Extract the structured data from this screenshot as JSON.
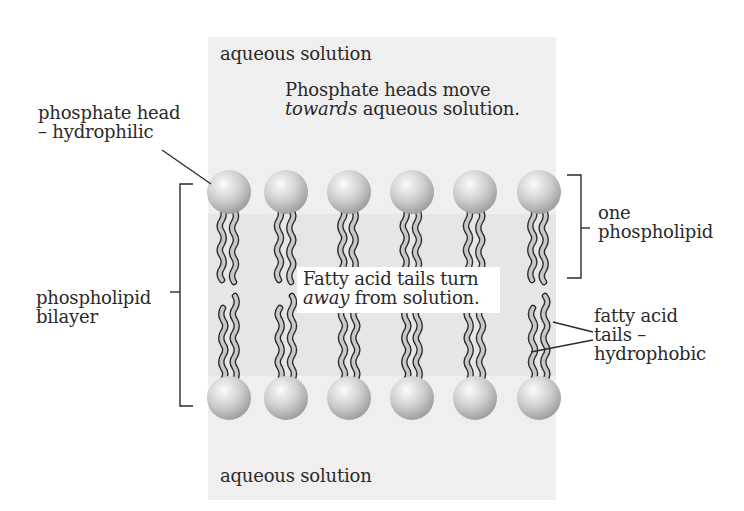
{
  "diagram": {
    "regions": {
      "top_solution": "aqueous solution",
      "bottom_solution": "aqueous solution"
    },
    "captions": {
      "heads_line1": "Phosphate heads move",
      "heads_line2_italic": "towards",
      "heads_line2_rest": " aqueous solution.",
      "tails_line1": "Fatty acid tails turn",
      "tails_line2_italic": "away",
      "tails_line2_rest": " from solution."
    },
    "labels": {
      "phosphate_head_line1": "phosphate head",
      "phosphate_head_line2": "– hydrophilic",
      "bilayer_line1": "phospholipid",
      "bilayer_line2": "bilayer",
      "one_phospholipid_line1": "one",
      "one_phospholipid_line2": "phospholipid",
      "tails_line1": "fatty acid",
      "tails_line2": "tails –",
      "tails_line3": "hydrophobic"
    },
    "structure": {
      "phospholipids_per_layer": 6,
      "layers": 2
    },
    "colors": {
      "panel": "#efefef",
      "tail_band": "#e6e6e6",
      "head_light": "#f7f7f7",
      "head_dark": "#a9a9a9",
      "tail_fill": "#c8c8c8",
      "line": "#2a2a2a"
    }
  }
}
